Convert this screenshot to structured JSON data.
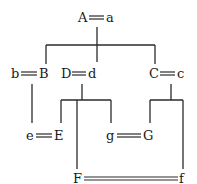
{
  "diagram": {
    "nodes": [
      {
        "id": "Aa",
        "left": "A",
        "right": "a",
        "x_left": 78,
        "x_eq1": 89,
        "x_eq2": 104,
        "x_right": 106,
        "y": 22
      },
      {
        "id": "bB",
        "left": "b",
        "right": "B",
        "x_left": 10,
        "x_eq1": 21,
        "x_eq2": 37,
        "x_right": 39,
        "y": 78
      },
      {
        "id": "Dd",
        "left": "D",
        "right": "d",
        "x_left": 60,
        "x_eq1": 72,
        "x_eq2": 86,
        "x_right": 88,
        "y": 78
      },
      {
        "id": "Cc",
        "left": "C",
        "right": "c",
        "x_left": 148,
        "x_eq1": 160,
        "x_eq2": 175,
        "x_right": 177,
        "y": 78
      },
      {
        "id": "eE",
        "left": "e",
        "right": "E",
        "x_left": 25,
        "x_eq1": 36,
        "x_eq2": 52,
        "x_right": 54,
        "y": 140
      },
      {
        "id": "gG",
        "left": "g",
        "right": "G",
        "x_left": 105,
        "x_eq1": 117,
        "x_eq2": 141,
        "x_right": 143,
        "y": 140
      },
      {
        "id": "Ff",
        "left": "F",
        "right": "f",
        "x_left": 72,
        "x_eq1": 84,
        "x_eq2": 178,
        "x_right": 179,
        "y": 183
      }
    ],
    "colors": {
      "line": "#2a2a2a",
      "text": "#1a1a1a",
      "background": "#ffffff"
    }
  }
}
